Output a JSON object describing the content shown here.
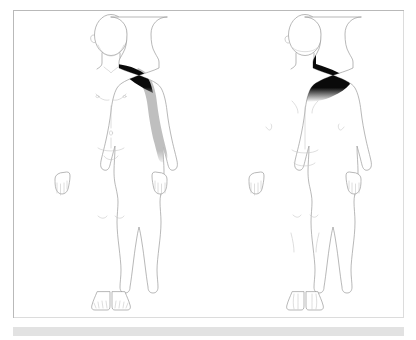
{
  "panel": {
    "background_color": "#ffffff",
    "border_color": "#b9b9b9"
  },
  "footer": {
    "bar_color": "#e2e2e2",
    "label": ""
  },
  "colors": {
    "outline": "#9a9a9a",
    "detail": "#b0b0b0",
    "shaded_region": "#bfbfbf",
    "marked_region": "#0a0a0a",
    "skin_fill": "#ffffff"
  },
  "figures": [
    {
      "id": "anterior",
      "view_label": "Anterior",
      "position": "left",
      "sex": "male",
      "regions": [
        {
          "name": "left-shoulder-trapezius",
          "label": "Left shoulder / upper trapezius",
          "shading": "solid-black",
          "color": "#0a0a0a",
          "side": "left"
        },
        {
          "name": "right-shoulder-trapezius",
          "label": "Right shoulder / upper trapezius",
          "shading": "solid-black",
          "color": "#0a0a0a",
          "side": "right"
        },
        {
          "name": "left-arm",
          "label": "Left arm (deltoid to wrist)",
          "shading": "gray",
          "color": "#bfbfbf",
          "side": "left"
        },
        {
          "name": "right-arm",
          "label": "Right arm (deltoid to wrist)",
          "shading": "gray",
          "color": "#bfbfbf",
          "side": "right"
        }
      ]
    },
    {
      "id": "posterior",
      "view_label": "Posterior",
      "position": "right",
      "sex": "male",
      "regions": [
        {
          "name": "neck-upper-back-cape",
          "label": "Posterior neck and upper back / trapezius",
          "shading": "solid-black",
          "color": "#0a0a0a",
          "side": "bilateral"
        }
      ]
    }
  ]
}
